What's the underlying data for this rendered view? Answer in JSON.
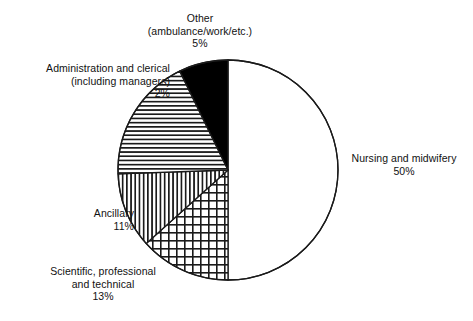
{
  "chart_data": {
    "type": "pie",
    "title": "",
    "subtitle": "",
    "xlabel": "",
    "ylabel": "",
    "legend_position": "none",
    "grid": false,
    "value_unit": "%",
    "categories": [
      "Nursing and midwifery",
      "Scientific, professional and technical",
      "Ancillary",
      "Administration and clerical (including managers)",
      "Other (ambulance/work/etc.)"
    ],
    "values": [
      50,
      13,
      11,
      2,
      5
    ],
    "slices": [
      {
        "name": "nursing-and-midwifery",
        "label_lines": [
          "Nursing and midwifery",
          "50%"
        ],
        "value": 50,
        "value_text": "50%",
        "fill": "white",
        "pattern": "none",
        "start_angle_deg": 0,
        "end_angle_deg": 180
      },
      {
        "name": "scientific-professional-and-technical",
        "label_lines": [
          "Scientific, professional",
          "and technical",
          "13%"
        ],
        "value": 13,
        "value_text": "13%",
        "fill": "white",
        "pattern": "crosshatch",
        "start_angle_deg": 180,
        "end_angle_deg": 228
      },
      {
        "name": "ancillary",
        "label_lines": [
          "Ancillary",
          "11%"
        ],
        "value": 11,
        "value_text": "11%",
        "fill": "white",
        "pattern": "vertical-lines",
        "start_angle_deg": 228,
        "end_angle_deg": 268
      },
      {
        "name": "administration-and-clerical",
        "label_lines": [
          "Administration and clerical",
          "(including managers)",
          "2%"
        ],
        "value": 2,
        "value_text": "2%",
        "fill": "white",
        "pattern": "horizontal-lines",
        "start_angle_deg": 268,
        "end_angle_deg": 334
      },
      {
        "name": "other-ambulance-work-etc",
        "label_lines": [
          "Other",
          "(ambulance/work/etc.)",
          "5%"
        ],
        "value": 5,
        "value_text": "5%",
        "fill": "black",
        "pattern": "solid",
        "start_angle_deg": 334,
        "end_angle_deg": 360
      }
    ],
    "colors": {
      "background": "#ffffff",
      "outline": "#1a1a1a",
      "solid_slice": "#000000",
      "hatch": "#1a1a1a",
      "text": "#111111"
    },
    "geometry": {
      "center_x": 228,
      "center_y": 170,
      "radius": 110
    }
  },
  "labels": {
    "other": {
      "line1": "Other",
      "line2": "(ambulance/work/etc.)",
      "line3": "5%"
    },
    "administration": {
      "line1": "Administration and clerical",
      "line2": "(including managers)",
      "line3": "2%"
    },
    "ancillary": {
      "line1": "Ancillary",
      "line2": "11%"
    },
    "scientific": {
      "line1": "Scientific, professional",
      "line2": "and technical",
      "line3": "13%"
    },
    "nursing": {
      "line1": "Nursing and midwifery",
      "line2": "50%"
    }
  }
}
